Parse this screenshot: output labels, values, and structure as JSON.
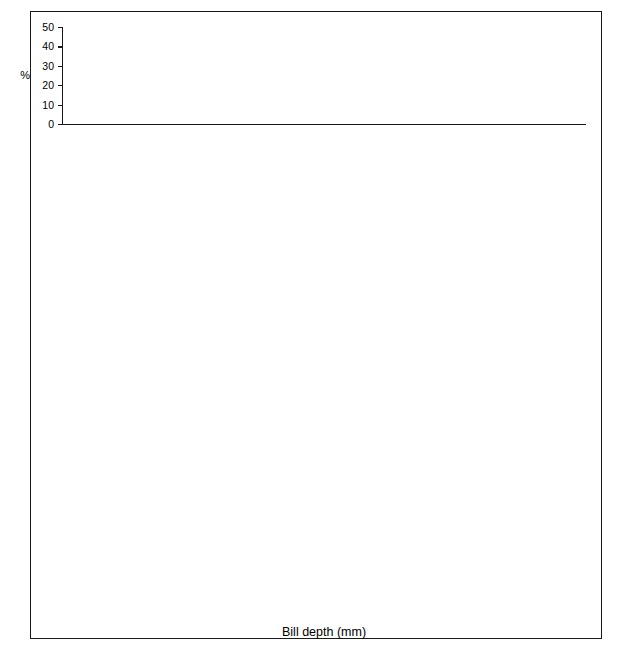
{
  "figure": {
    "xaxis_title": "Bill depth (mm)",
    "yaxis_title": "%",
    "x_tick_labels": [
      "7",
      "8",
      "9",
      "10",
      "11",
      "12",
      "13",
      "14",
      "15",
      "16",
      "17",
      "18",
      "19",
      "20",
      "21",
      "22",
      "23"
    ],
    "x_min": 6.3,
    "x_max": 23.7,
    "colors": {
      "ink": "#1a1a1a",
      "solid_fill": "#111111",
      "grid_fill": "#e9e9e9",
      "hatch_fill": "#ffffff",
      "background": "#ffffff"
    }
  },
  "chart_data": {
    "type": "bar",
    "title": "",
    "xlabel": "Bill depth (mm)",
    "ylabel": "%",
    "xlim": [
      6.3,
      23.7
    ],
    "grid": false,
    "legend_position": "inline-annotation",
    "bin_width": 0.35,
    "panels": [
      {
        "locality": "Abingdon, Bindloe, James, Jervis",
        "ylim": [
          0,
          50
        ],
        "y_tick_labels": [
          "0",
          "10",
          "20",
          "30",
          "40",
          "50"
        ],
        "y_ticks": [
          0,
          10,
          20,
          30,
          40,
          50
        ],
        "series": [
          {
            "name": "fuliginosa",
            "fill": "grid",
            "label_x": 8.9,
            "label_y": 42,
            "bins": [
              6.3,
              6.65,
              7.0,
              7.35,
              7.7,
              8.05,
              8.4,
              8.75,
              9.1
            ],
            "values": [
              1,
              1,
              12,
              30,
              48,
              48,
              9,
              1
            ]
          },
          {
            "name": "fortis",
            "fill": "solid",
            "label_x": 13.2,
            "label_y": 27,
            "bins": [
              10.5,
              10.85,
              11.2,
              11.55,
              11.9,
              12.25,
              12.6,
              12.95,
              13.3,
              13.65,
              14.35
            ],
            "values": [
              1,
              2,
              21,
              22,
              22,
              33,
              12,
              12,
              1,
              1
            ]
          },
          {
            "name": "magnirostris",
            "fill": "hatch",
            "label_x": 21.3,
            "label_y": 22,
            "bins": [
              15.8,
              16.2,
              16.75,
              17.1,
              17.45,
              17.8,
              18.15,
              18.5,
              19.2,
              19.55,
              19.9,
              20.25,
              20.6,
              20.95,
              21.3,
              21.65,
              22.0,
              22.35
            ],
            "values": [
              1,
              1,
              7,
              2,
              2,
              11,
              13,
              13,
              19,
              14,
              14,
              21,
              21,
              10,
              10,
              4,
              1
            ]
          }
        ]
      },
      {
        "locality": "Albemarle, Indefatigable",
        "ylim": [
          0,
          50
        ],
        "y_tick_labels": [
          "0",
          "10",
          "20",
          "30",
          "40",
          "50"
        ],
        "y_ticks": [
          0,
          10,
          20,
          30,
          40,
          50
        ],
        "series": [
          {
            "name": "fuliginosa",
            "fill": "grid",
            "label_x": 8.9,
            "label_y": 44,
            "bins": [
              6.95,
              7.3,
              7.65,
              8.0,
              8.35,
              8.7,
              9.05,
              9.4
            ],
            "values": [
              10,
              52,
              52,
              28,
              10,
              10,
              2
            ]
          },
          {
            "name": "fortis",
            "fill": "solid",
            "label_x": 13.7,
            "label_y": 22,
            "bins": [
              10.0,
              10.35,
              10.7,
              11.05,
              11.4,
              11.75,
              12.1,
              12.45,
              12.8,
              13.15,
              13.5,
              13.85,
              14.2,
              14.55,
              14.9,
              15.25,
              15.6,
              15.95,
              16.3
            ],
            "values": [
              2,
              2,
              2,
              6,
              11,
              11,
              16,
              19,
              19,
              11,
              11,
              11,
              9,
              9,
              5,
              5,
              5,
              4
            ]
          },
          {
            "name": "magnirostris",
            "fill": "hatch",
            "label_x": 21.4,
            "label_y": 20,
            "bins": [
              16.65,
              17.0,
              17.35,
              17.7,
              18.05,
              18.4,
              18.75,
              19.1,
              19.45,
              19.8,
              20.15,
              20.5,
              20.85,
              21.2
            ],
            "values": [
              19,
              12,
              12,
              3,
              3,
              10,
              19,
              10,
              10,
              10,
              2,
              19,
              19
            ]
          }
        ]
      },
      {
        "locality": "Charles, Chatham",
        "ylim": [
          0,
          50
        ],
        "y_tick_labels": [
          "0",
          "10",
          "20",
          "30",
          "40",
          "50"
        ],
        "y_ticks": [
          0,
          10,
          20,
          30,
          40,
          50
        ],
        "series": [
          {
            "name": "fuliginosa",
            "fill": "grid",
            "label_x": 8.9,
            "label_y": 42,
            "bins": [
              6.65,
              7.0,
              7.35,
              7.7,
              8.05,
              8.4,
              8.75,
              9.1
            ],
            "values": [
              2,
              2,
              17,
              48,
              48,
              25,
              9
            ]
          },
          {
            "name": "fortis",
            "fill": "solid",
            "label_x": 12.8,
            "label_y": 28,
            "bins": [
              9.7,
              10.05,
              10.4,
              10.75,
              11.1,
              11.45,
              11.8,
              12.15,
              12.5,
              12.85,
              13.2,
              13.55,
              13.9,
              14.25,
              14.6,
              14.95,
              15.3,
              15.65,
              16.0,
              16.35,
              16.7
            ],
            "values": [
              1,
              1,
              1,
              5,
              5,
              9,
              25,
              18,
              11,
              11,
              9,
              9,
              8,
              8,
              6,
              4,
              4,
              2,
              2,
              1
            ]
          }
        ]
      },
      {
        "locality": "Daphne",
        "ylim": [
          0,
          40
        ],
        "y_tick_labels": [
          "0",
          "10",
          "20",
          "30",
          "40"
        ],
        "y_ticks": [
          0,
          10,
          20,
          30,
          40
        ],
        "series": [
          {
            "name": "fortis",
            "fill": "solid",
            "label_x": 11.3,
            "label_y": 25,
            "bins": [
              9.45,
              9.8,
              10.15,
              10.5,
              10.85,
              11.2,
              11.55,
              11.9,
              12.25
            ],
            "values": [
              3,
              12,
              15,
              31,
              20,
              12,
              12,
              3
            ]
          }
        ]
      },
      {
        "locality": "Crossman",
        "ylim": [
          0,
          40
        ],
        "y_tick_labels": [
          "0",
          "10",
          "20",
          "30",
          "40"
        ],
        "y_ticks": [
          0,
          10,
          20,
          30,
          40
        ],
        "series": [
          {
            "name": "fuliginosa",
            "fill": "grid",
            "label_x": 10.4,
            "label_y": 31,
            "bins": [
              8.3,
              8.65,
              9.0,
              9.35,
              9.7,
              10.05,
              10.4,
              10.75
            ],
            "values": [
              28,
              9,
              9,
              9,
              38,
              19,
              19
            ]
          }
        ]
      }
    ]
  }
}
